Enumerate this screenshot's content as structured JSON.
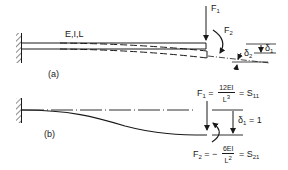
{
  "diagram": {
    "stroke_color": "#1a1a1a",
    "part_a": {
      "label": "(a)",
      "beam_props": "E,I,L",
      "force_1": "F",
      "force_1_sub": "1",
      "force_2": "F",
      "force_2_sub": "2",
      "delta_1": "δ",
      "delta_1_sub": "1",
      "delta_2": "δ",
      "delta_2_sub": "2"
    },
    "part_b": {
      "label": "(b)",
      "f1_lhs": "F",
      "f1_lhs_sub": "1",
      "f1_eq": "=",
      "f1_num": "12EI",
      "f1_den": "L",
      "f1_den_exp": "3",
      "f1_rhs_eq": "=",
      "f1_rhs": "S",
      "f1_rhs_sub": "11",
      "delta_1": "δ",
      "delta_1_sub": "1",
      "delta_1_val": "= 1",
      "f2_lhs": "F",
      "f2_lhs_sub": "2",
      "f2_eq": "= −",
      "f2_num": "6EI",
      "f2_den": "L",
      "f2_den_exp": "2",
      "f2_rhs_eq": "=",
      "f2_rhs": "S",
      "f2_rhs_sub": "21"
    }
  }
}
